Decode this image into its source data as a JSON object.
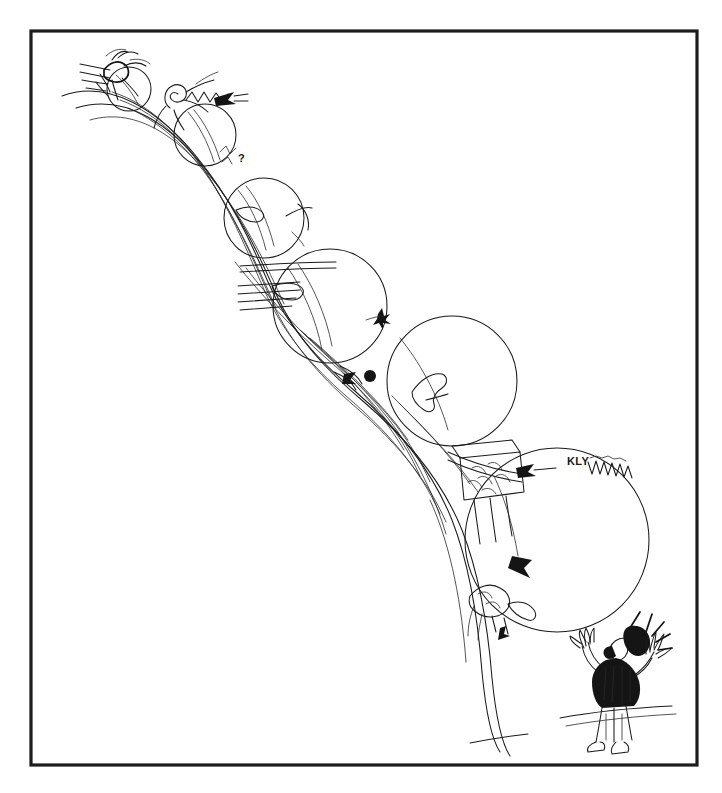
{
  "artwork": {
    "title": "Snowball Effect",
    "caption_text": "KLY",
    "medium": "pen-and-ink line drawing",
    "background_color": "#ffffff",
    "ink_color": "#1a1a1a",
    "frame_color": "#1c1c1c",
    "frame": {
      "x": 31,
      "y": 31,
      "width": 666,
      "height": 734,
      "stroke_width": 3.2
    }
  },
  "scene": {
    "description": "A hand-drawn cartoon of snowballs growing larger as they roll down a winding slope, sweeping up people, houses and trees, while a man at the bottom shouts in alarm.",
    "slope_label": "downhill slope",
    "elements": [
      {
        "name": "snowball-1",
        "label": "smallest snowball",
        "cx": 129,
        "cy": 89,
        "r": 22
      },
      {
        "name": "snowball-2",
        "label": "small snowball",
        "cx": 205,
        "cy": 135,
        "r": 31
      },
      {
        "name": "snowball-3",
        "label": "medium snowball",
        "cx": 264,
        "cy": 218,
        "r": 40
      },
      {
        "name": "snowball-4",
        "label": "large snowball",
        "cx": 330,
        "cy": 306,
        "r": 57
      },
      {
        "name": "snowball-5",
        "label": "larger snowball",
        "cx": 452,
        "cy": 381,
        "r": 65
      },
      {
        "name": "snowball-6",
        "label": "giant snowball",
        "cx": 557,
        "cy": 540,
        "r": 92
      }
    ],
    "figures": [
      {
        "name": "runner-top",
        "label": "fleeing figure at top of slope"
      },
      {
        "name": "tumbling-figure",
        "label": "figure swept into snowball"
      },
      {
        "name": "shouting-man",
        "label": "man shouting with raised hands"
      }
    ],
    "props": [
      {
        "name": "question-mark",
        "label": "?"
      },
      {
        "name": "dart-arrow",
        "label": "dart"
      },
      {
        "name": "swept-house",
        "label": "house caught in snowball"
      },
      {
        "name": "swept-trees",
        "label": "trees caught in snowball"
      },
      {
        "name": "shout-rays",
        "label": "radiating alarm lines"
      }
    ]
  }
}
